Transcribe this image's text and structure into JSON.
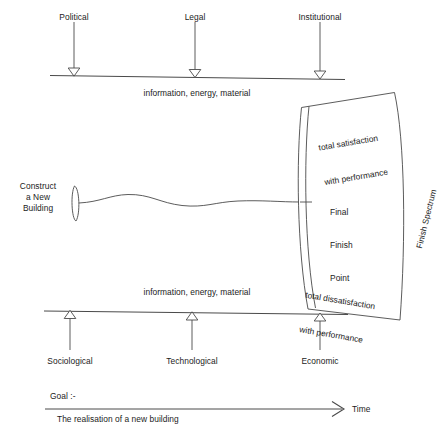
{
  "diagram": {
    "stroke_color": "#4a4a4a",
    "text_color": "#1b1b1b",
    "background": "#ffffff"
  },
  "top_inputs": {
    "flow_label": "information, energy, material",
    "items": [
      {
        "label": "Political"
      },
      {
        "label": "Legal"
      },
      {
        "label": "Institutional"
      }
    ]
  },
  "bottom_inputs": {
    "flow_label": "information, energy, material",
    "items": [
      {
        "label": "Sociological"
      },
      {
        "label": "Technological"
      },
      {
        "label": "Economic"
      }
    ]
  },
  "process": {
    "start_label": "Construct\na New\nBuilding",
    "start_line1": "Construct",
    "start_line2": "a New",
    "start_line3": "Building"
  },
  "spectrum": {
    "name": "Finish Spectrum",
    "top_label_line1": "total satisfaction",
    "top_label_line2": "with performance",
    "bottom_label_line1": "total dissatisfaction",
    "bottom_label_line2": "with performance",
    "center_label_line1": "Final",
    "center_label_line2": "Finish",
    "center_label_line3": "Point"
  },
  "goal": {
    "heading": "Goal :-",
    "statement": "The realisation of a new building",
    "axis_label": "Time"
  }
}
